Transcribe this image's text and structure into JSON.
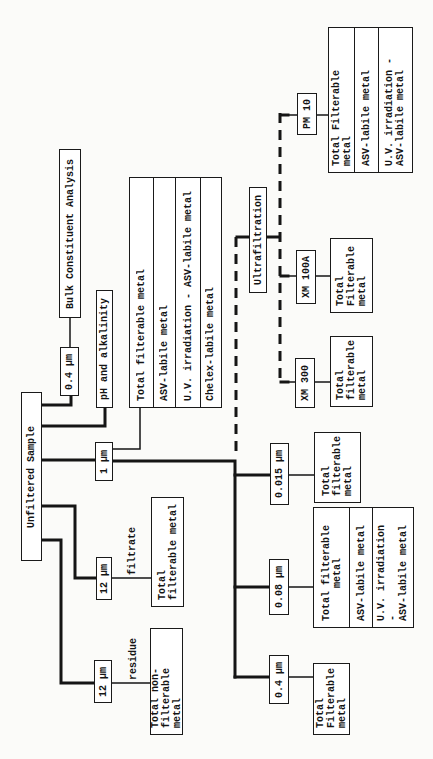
{
  "nodes": {
    "unfiltered_sample": {
      "label": "Unfiltered Sample"
    },
    "bulk_analysis": {
      "label": "Bulk Constituent Analysis"
    },
    "filter_04_top": {
      "label": "0.4 µm"
    },
    "ph_alkalinity": {
      "label": "pH and alkalinity"
    },
    "filter_1um": {
      "label": "1 µm"
    },
    "table_1um": {
      "rows": [
        "Total filterable metal",
        "ASV-labile metal",
        "U.V. irradiation - ASV-labile metal",
        "Chelex-labile metal"
      ]
    },
    "filter_12_filtrate": {
      "label": "12 µm",
      "edge_label": "filtrate"
    },
    "result_filtrate": {
      "label": "Total\nfilterable metal"
    },
    "filter_12_residue": {
      "label": "12 µm",
      "edge_label": "residue"
    },
    "result_residue": {
      "label": "Total non-\nfilterable metal"
    },
    "filter_0015": {
      "label": "0.015 µm"
    },
    "result_0015": {
      "label": "Total\nfilterable\nmetal"
    },
    "filter_008": {
      "label": "0.08 µm"
    },
    "table_008": {
      "rows": [
        "Total filterable\nmetal",
        "ASV-labile metal",
        "U.V. irradiation -\nASV-labile metal"
      ]
    },
    "filter_04_bottom": {
      "label": "0.4 µm"
    },
    "result_04_bottom": {
      "label": "Total\nFilterable\nmetal"
    },
    "ultrafiltration": {
      "label": "Ultrafiltration"
    },
    "xm_100a": {
      "label": "XM 100A"
    },
    "result_xm_100a": {
      "label": "Total\nFilterable\nmetal"
    },
    "xm_300": {
      "label": "XM 300"
    },
    "result_xm_300": {
      "label": "Total\nfilterable\nmetal"
    },
    "pm_10": {
      "label": "PM 10"
    },
    "table_pm10": {
      "rows": [
        "Total Filterable metal",
        "ASV-labile metal",
        "U.V. irradiation -\nASV-labile metal"
      ]
    }
  },
  "edges": [
    {
      "from": "unfiltered_sample",
      "to": "filter_04_top",
      "style": "solid"
    },
    {
      "from": "filter_04_top",
      "to": "bulk_analysis",
      "style": "solid"
    },
    {
      "from": "unfiltered_sample",
      "to": "ph_alkalinity",
      "style": "solid"
    },
    {
      "from": "unfiltered_sample",
      "to": "filter_1um",
      "style": "solid"
    },
    {
      "from": "filter_1um",
      "to": "table_1um",
      "style": "solid"
    },
    {
      "from": "filter_1um",
      "to": "filter_0015",
      "style": "solid"
    },
    {
      "from": "filter_1um",
      "to": "filter_008",
      "style": "solid"
    },
    {
      "from": "filter_1um",
      "to": "filter_04_bottom",
      "style": "solid"
    },
    {
      "from": "filter_1um",
      "to": "ultrafiltration",
      "style": "dashed"
    },
    {
      "from": "filter_0015",
      "to": "result_0015",
      "style": "solid"
    },
    {
      "from": "filter_008",
      "to": "table_008",
      "style": "solid"
    },
    {
      "from": "filter_04_bottom",
      "to": "result_04_bottom",
      "style": "solid"
    },
    {
      "from": "ultrafiltration",
      "to": "pm_10",
      "style": "dashed"
    },
    {
      "from": "ultrafiltration",
      "to": "xm_100a",
      "style": "dashed"
    },
    {
      "from": "ultrafiltration",
      "to": "xm_300",
      "style": "dashed"
    },
    {
      "from": "pm_10",
      "to": "table_pm10",
      "style": "solid"
    },
    {
      "from": "xm_100a",
      "to": "result_xm_100a",
      "style": "solid"
    },
    {
      "from": "xm_300",
      "to": "result_xm_300",
      "style": "solid"
    },
    {
      "from": "unfiltered_sample",
      "to": "filter_12_filtrate",
      "style": "solid"
    },
    {
      "from": "filter_12_filtrate",
      "to": "result_filtrate",
      "label": "filtrate",
      "style": "solid"
    },
    {
      "from": "unfiltered_sample",
      "to": "filter_12_residue",
      "style": "solid"
    },
    {
      "from": "filter_12_residue",
      "to": "result_residue",
      "label": "residue",
      "style": "solid"
    }
  ]
}
